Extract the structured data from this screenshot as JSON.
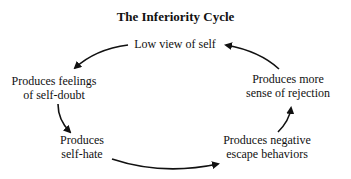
{
  "title": "The Inferiority Cycle",
  "nodes": [
    {
      "id": "low-view",
      "lines": [
        "Low view of self"
      ]
    },
    {
      "id": "self-doubt",
      "lines": [
        "Produces feelings",
        "of self-doubt"
      ]
    },
    {
      "id": "self-hate",
      "lines": [
        "Produces",
        "self-hate"
      ]
    },
    {
      "id": "escape",
      "lines": [
        "Produces negative",
        "escape behaviors"
      ]
    },
    {
      "id": "rejection",
      "lines": [
        "Produces more",
        "sense of rejection"
      ]
    }
  ],
  "edges": [
    {
      "from": "low-view",
      "to": "self-doubt"
    },
    {
      "from": "self-doubt",
      "to": "self-hate"
    },
    {
      "from": "self-hate",
      "to": "escape"
    },
    {
      "from": "escape",
      "to": "rejection"
    },
    {
      "from": "rejection",
      "to": "low-view"
    }
  ],
  "colors": {
    "ink": "#111111",
    "background": "#ffffff"
  }
}
